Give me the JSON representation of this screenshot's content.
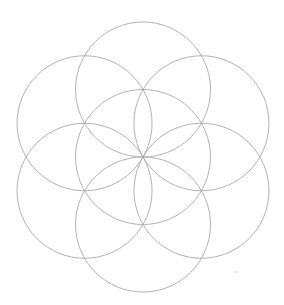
{
  "figure": {
    "circle_count": 7,
    "line_color": "#a9a9a9",
    "background_color": "#ffffff",
    "circles": [
      {
        "name": "center",
        "angle_deg": null
      },
      {
        "name": "top",
        "angle_deg": 90
      },
      {
        "name": "upper-right",
        "angle_deg": 30
      },
      {
        "name": "lower-right",
        "angle_deg": -30
      },
      {
        "name": "bottom",
        "angle_deg": -90
      },
      {
        "name": "lower-left",
        "angle_deg": -150
      },
      {
        "name": "upper-left",
        "angle_deg": 150
      }
    ]
  }
}
